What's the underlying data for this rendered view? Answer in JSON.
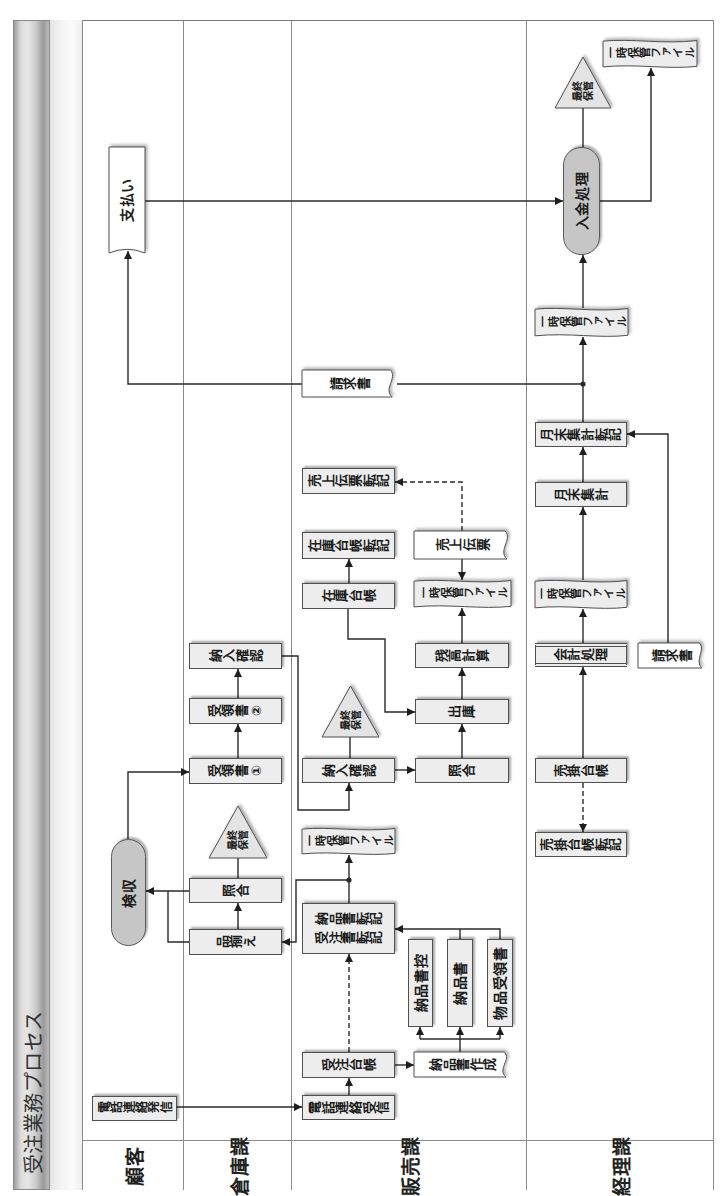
{
  "title": "受注業務プロセス",
  "lanes": [
    {
      "label": "顧客",
      "nodes": [
        {
          "label": "支払い",
          "shape": "document"
        },
        {
          "label": "検収",
          "shape": "terminal"
        },
        {
          "label": "電話連絡発信",
          "shape": "process"
        }
      ]
    },
    {
      "label": "倉庫課",
      "nodes": [
        {
          "label": "納入確認",
          "shape": "process"
        },
        {
          "label": "受領書②",
          "shape": "process"
        },
        {
          "label": "受領書①",
          "shape": "process"
        },
        {
          "label_lines": [
            "最終",
            "保管"
          ],
          "shape": "storage"
        },
        {
          "label": "照合",
          "shape": "process"
        },
        {
          "label": "品揃え",
          "shape": "process"
        }
      ]
    },
    {
      "label": "販売課",
      "nodes": [
        {
          "label": "請求書",
          "shape": "document"
        },
        {
          "label": "売上伝票転記",
          "shape": "process"
        },
        {
          "label": "在庫台帳転記",
          "shape": "process"
        },
        {
          "label": "売上伝票",
          "shape": "document"
        },
        {
          "label": "在庫台帳",
          "shape": "process"
        },
        {
          "label": "一時保管ファイル",
          "shape": "tape"
        },
        {
          "label": "残高計算",
          "shape": "process"
        },
        {
          "label": "出庫",
          "shape": "process"
        },
        {
          "label_lines": [
            "最終",
            "保管"
          ],
          "shape": "storage"
        },
        {
          "label": "納入確認",
          "shape": "process"
        },
        {
          "label": "照合",
          "shape": "process"
        },
        {
          "label": "一時保管ファイル",
          "shape": "tape"
        },
        {
          "label_lines": [
            "納品書転記",
            "受注書転記"
          ],
          "shape": "process"
        },
        {
          "label": "納品書控",
          "shape": "process"
        },
        {
          "label": "納品書",
          "shape": "process"
        },
        {
          "label": "物品受領書",
          "shape": "process"
        },
        {
          "label": "受注台帳",
          "shape": "process"
        },
        {
          "label": "納品書作成",
          "shape": "document"
        },
        {
          "label": "電話連絡受信",
          "shape": "process"
        }
      ]
    },
    {
      "label": "経理課",
      "nodes": [
        {
          "label": "一時保管ファイル",
          "shape": "tape"
        },
        {
          "label_lines": [
            "最終",
            "保管"
          ],
          "shape": "storage"
        },
        {
          "label": "入金処理",
          "shape": "terminal"
        },
        {
          "label": "一時保管ファイル",
          "shape": "tape"
        },
        {
          "label": "月末集計転記",
          "shape": "process"
        },
        {
          "label": "月末集計",
          "shape": "process"
        },
        {
          "label": "一時保管ファイル",
          "shape": "tape"
        },
        {
          "label": "会計処理",
          "shape": "predefined-process"
        },
        {
          "label": "請求書",
          "shape": "document"
        },
        {
          "label": "売掛台帳",
          "shape": "process"
        },
        {
          "label": "売掛台帳転記",
          "shape": "process"
        }
      ]
    }
  ],
  "edges": [
    {
      "from": [
        0,
        2
      ],
      "to": [
        2,
        18
      ],
      "style": "solid"
    },
    {
      "from": [
        2,
        18
      ],
      "to": [
        2,
        16
      ],
      "style": "solid"
    },
    {
      "from": [
        2,
        16
      ],
      "to": [
        2,
        17
      ],
      "style": "solid"
    },
    {
      "from": [
        2,
        16
      ],
      "to": [
        2,
        12
      ],
      "style": "dashed"
    },
    {
      "from": [
        2,
        17
      ],
      "to": [
        2,
        13
      ],
      "style": "solid"
    },
    {
      "from": [
        2,
        17
      ],
      "to": [
        2,
        14
      ],
      "style": "solid"
    },
    {
      "from": [
        2,
        17
      ],
      "to": [
        2,
        15
      ],
      "style": "solid"
    },
    {
      "from": [
        2,
        14
      ],
      "to": [
        2,
        12
      ],
      "style": "solid"
    },
    {
      "from": [
        2,
        15
      ],
      "to": [
        2,
        12
      ],
      "style": "solid"
    },
    {
      "from": [
        2,
        12
      ],
      "to": [
        2,
        11
      ],
      "style": "solid"
    },
    {
      "from": [
        2,
        12
      ],
      "to": [
        1,
        5
      ],
      "style": "solid"
    },
    {
      "from": [
        1,
        5
      ],
      "to": [
        1,
        4
      ],
      "style": "solid"
    },
    {
      "from": [
        1,
        4
      ],
      "to": [
        1,
        3
      ],
      "style": "line"
    },
    {
      "from": [
        1,
        4
      ],
      "to": [
        0,
        1
      ],
      "style": "solid"
    },
    {
      "from": [
        1,
        5
      ],
      "to": [
        0,
        1
      ],
      "style": "solid"
    },
    {
      "from": [
        0,
        1
      ],
      "to": [
        1,
        2
      ],
      "style": "solid"
    },
    {
      "from": [
        1,
        2
      ],
      "to": [
        1,
        1
      ],
      "style": "solid"
    },
    {
      "from": [
        1,
        1
      ],
      "to": [
        1,
        0
      ],
      "style": "solid"
    },
    {
      "from": [
        1,
        0
      ],
      "to": [
        2,
        9
      ],
      "style": "solid"
    },
    {
      "from": [
        2,
        9
      ],
      "to": [
        2,
        8
      ],
      "style": "line"
    },
    {
      "from": [
        2,
        9
      ],
      "to": [
        2,
        10
      ],
      "style": "solid"
    },
    {
      "from": [
        2,
        10
      ],
      "to": [
        2,
        7
      ],
      "style": "solid"
    },
    {
      "from": [
        2,
        4
      ],
      "to": [
        2,
        7
      ],
      "style": "solid"
    },
    {
      "from": [
        2,
        7
      ],
      "to": [
        2,
        6
      ],
      "style": "solid"
    },
    {
      "from": [
        2,
        6
      ],
      "to": [
        2,
        5
      ],
      "style": "solid"
    },
    {
      "from": [
        2,
        3
      ],
      "to": [
        2,
        5
      ],
      "style": "solid"
    },
    {
      "from": [
        2,
        3
      ],
      "to": [
        2,
        1
      ],
      "style": "dashed"
    },
    {
      "from": [
        2,
        4
      ],
      "to": [
        2,
        2
      ],
      "style": "solid"
    },
    {
      "from": [
        3,
        9
      ],
      "to": [
        3,
        10
      ],
      "style": "dashed"
    },
    {
      "from": [
        3,
        9
      ],
      "to": [
        3,
        7
      ],
      "style": "solid"
    },
    {
      "from": [
        3,
        7
      ],
      "to": [
        3,
        6
      ],
      "style": "solid"
    },
    {
      "from": [
        3,
        6
      ],
      "to": [
        3,
        5
      ],
      "style": "solid"
    },
    {
      "from": [
        3,
        5
      ],
      "to": [
        3,
        4
      ],
      "style": "solid"
    },
    {
      "from": [
        3,
        8
      ],
      "to": [
        3,
        4
      ],
      "style": "solid"
    },
    {
      "from": [
        3,
        4
      ],
      "to": [
        3,
        3
      ],
      "style": "solid"
    },
    {
      "from": [
        3,
        4
      ],
      "to": [
        2,
        0
      ],
      "style": "line"
    },
    {
      "from": [
        2,
        0
      ],
      "to": [
        0,
        0
      ],
      "style": "solid"
    },
    {
      "from": [
        3,
        3
      ],
      "to": [
        3,
        2
      ],
      "style": "solid"
    },
    {
      "from": [
        0,
        0
      ],
      "to": [
        3,
        2
      ],
      "style": "solid"
    },
    {
      "from": [
        3,
        2
      ],
      "to": [
        3,
        1
      ],
      "style": "line"
    },
    {
      "from": [
        3,
        2
      ],
      "to": [
        3,
        0
      ],
      "style": "solid"
    }
  ],
  "colors": {
    "process_fill": "#ededed",
    "terminal_fill": "#c6c6c6",
    "document_fill": "#ffffff",
    "line": "#2a2a2a",
    "border": "#505050"
  }
}
